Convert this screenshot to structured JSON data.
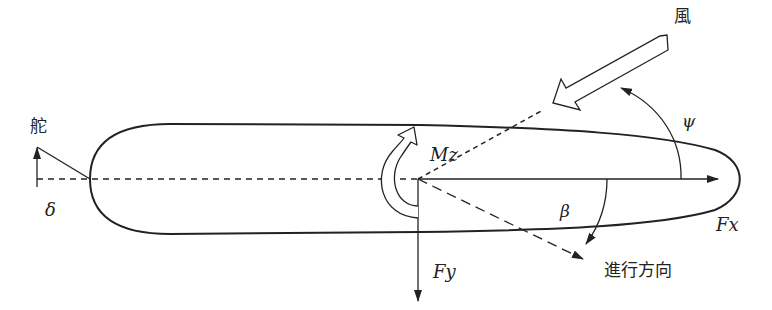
{
  "diagram": {
    "labels": {
      "rudder": "舵",
      "rudder_angle": "δ",
      "yaw_moment": "Mz",
      "wind": "風",
      "wind_angle": "ψ",
      "drift_angle": "β",
      "longitudinal_force": "Fx",
      "lateral_force": "Fy",
      "heading_direction": "進行方向"
    },
    "colors": {
      "stroke": "#222222",
      "background": "#ffffff"
    }
  }
}
